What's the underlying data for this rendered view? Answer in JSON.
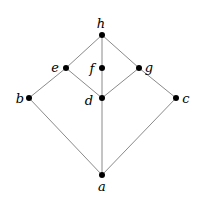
{
  "diagram": {
    "type": "hasse-lattice",
    "colors": {
      "edge": "#8a8a8a",
      "node": "#000000",
      "label": "#000000",
      "background": "#ffffff"
    },
    "nodes": [
      {
        "id": "a",
        "label": "a",
        "x": 102,
        "y": 175,
        "lx": 102,
        "ly": 191,
        "anchor": "middle"
      },
      {
        "id": "b",
        "label": "b",
        "x": 29,
        "y": 98,
        "lx": 20,
        "ly": 103,
        "anchor": "middle"
      },
      {
        "id": "c",
        "label": "c",
        "x": 176,
        "y": 98,
        "lx": 186,
        "ly": 103,
        "anchor": "middle"
      },
      {
        "id": "d",
        "label": "d",
        "x": 102,
        "y": 98,
        "lx": 89,
        "ly": 105,
        "anchor": "middle"
      },
      {
        "id": "e",
        "label": "e",
        "x": 66,
        "y": 68,
        "lx": 55,
        "ly": 72,
        "anchor": "middle"
      },
      {
        "id": "f",
        "label": "f",
        "x": 102,
        "y": 68,
        "lx": 92,
        "ly": 73,
        "anchor": "middle"
      },
      {
        "id": "g",
        "label": "g",
        "x": 139,
        "y": 68,
        "lx": 149,
        "ly": 72,
        "anchor": "middle"
      },
      {
        "id": "h",
        "label": "h",
        "x": 102,
        "y": 35,
        "lx": 101,
        "ly": 28,
        "anchor": "middle"
      }
    ],
    "edges": [
      [
        "a",
        "b"
      ],
      [
        "a",
        "c"
      ],
      [
        "a",
        "d"
      ],
      [
        "b",
        "e"
      ],
      [
        "c",
        "g"
      ],
      [
        "d",
        "e"
      ],
      [
        "d",
        "f"
      ],
      [
        "d",
        "g"
      ],
      [
        "e",
        "h"
      ],
      [
        "f",
        "h"
      ],
      [
        "g",
        "h"
      ]
    ]
  }
}
